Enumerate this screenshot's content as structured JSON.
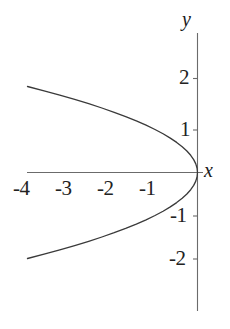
{
  "chart_data": {
    "type": "line",
    "title": "",
    "subtitle": "",
    "xlabel": "x",
    "ylabel": "y",
    "equation": "x = -y^2",
    "grid": false,
    "legend": null,
    "xlim": [
      -4.6,
      0.75
    ],
    "ylim": [
      -2.5,
      2.5
    ],
    "xticks": [
      -4,
      -3,
      -2,
      -1
    ],
    "yticks": [
      2,
      1,
      -1,
      -2
    ],
    "xtick_labels": [
      "-4",
      "-3",
      "-2",
      "-1"
    ],
    "ytick_labels": [
      "2",
      "1",
      "-1",
      "-2"
    ],
    "series": [
      {
        "name": "x = -y^2",
        "x": [
          -4.0,
          -3.61,
          -3.24,
          -2.89,
          -2.56,
          -2.25,
          -1.96,
          -1.69,
          -1.44,
          -1.21,
          -1.0,
          -0.81,
          -0.64,
          -0.49,
          -0.36,
          -0.25,
          -0.16,
          -0.09,
          -0.04,
          -0.01,
          0.0,
          -0.01,
          -0.04,
          -0.09,
          -0.16,
          -0.25,
          -0.36,
          -0.49,
          -0.64,
          -0.81,
          -1.0,
          -1.21,
          -1.44,
          -1.69,
          -1.96,
          -2.25,
          -2.56,
          -2.89,
          -3.24,
          -3.61,
          -4.0
        ],
        "y": [
          2.0,
          1.9,
          1.8,
          1.7,
          1.6,
          1.5,
          1.4,
          1.3,
          1.2,
          1.1,
          1.0,
          0.9,
          0.8,
          0.7,
          0.6,
          0.5,
          0.4,
          0.3,
          0.2,
          0.1,
          0.0,
          -0.1,
          -0.2,
          -0.3,
          -0.4,
          -0.5,
          -0.6,
          -0.7,
          -0.8,
          -0.9,
          -1.0,
          -1.1,
          -1.2,
          -1.3,
          -1.4,
          -1.5,
          -1.6,
          -1.7,
          -1.8,
          -1.9,
          -2.0
        ]
      }
    ],
    "colors": {
      "curve": "#3a3a3a",
      "axis": "#6b6b6b",
      "label": "#222222",
      "background": "#ffffff"
    }
  },
  "axes": {
    "x_name": "x",
    "y_name": "y"
  },
  "ticks": {
    "x": [
      {
        "label": "-4",
        "value": -4
      },
      {
        "label": "-3",
        "value": -3
      },
      {
        "label": "-2",
        "value": -2
      },
      {
        "label": "-1",
        "value": -1
      }
    ],
    "y": [
      {
        "label": "2",
        "value": 2
      },
      {
        "label": "1",
        "value": 1
      },
      {
        "label": "-1",
        "value": -1
      },
      {
        "label": "-2",
        "value": -2
      }
    ]
  }
}
